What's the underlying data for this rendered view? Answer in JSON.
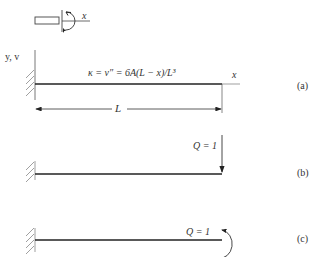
{
  "sign_convention": {
    "axis_label": "x"
  },
  "panel_a": {
    "axis_label_y": "y, v",
    "axis_label_x": "x",
    "formula": "κ = v″ = 6A(L − x)/L³",
    "dimension_label": "L",
    "tag": "(a)"
  },
  "panel_b": {
    "load_label": "Q = 1",
    "load_type": "point-force-downward",
    "tag": "(b)"
  },
  "panel_c": {
    "load_label": "Q = 1",
    "load_type": "moment-counterclockwise",
    "tag": "(c)"
  },
  "colors": {
    "line": "#333333",
    "hatch": "#888888"
  }
}
